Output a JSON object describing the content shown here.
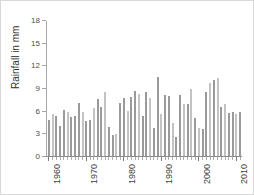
{
  "chart_data": {
    "type": "bar",
    "title": "",
    "xlabel": "",
    "ylabel": "Rainfall  in mm",
    "ylim": [
      0,
      18
    ],
    "yticks": [
      0,
      3,
      6,
      9,
      12,
      15,
      18
    ],
    "ytick_labels": [
      "0",
      "3",
      "6",
      "9",
      "12",
      "15",
      "18"
    ],
    "xlim": [
      1959.5,
      2011.5
    ],
    "xtick_labels": [
      "1960",
      "1970",
      "1980",
      "1990",
      "2000",
      "2010"
    ],
    "xticks": [
      1960,
      1970,
      1980,
      1990,
      2000,
      2010
    ],
    "grid": false,
    "legend": null,
    "bar_color": "#9a9a9a",
    "bar_color_alt": "#c3c3c3",
    "axis_color": "#8c8c8c",
    "categories": [
      "1960",
      "1961",
      "1962",
      "1963",
      "1964",
      "1965",
      "1966",
      "1967",
      "1968",
      "1969",
      "1970",
      "1971",
      "1972",
      "1973",
      "1974",
      "1975",
      "1976",
      "1977",
      "1978",
      "1979",
      "1980",
      "1981",
      "1982",
      "1983",
      "1984",
      "1985",
      "1986",
      "1987",
      "1988",
      "1989",
      "1990",
      "1991",
      "1992",
      "1993",
      "1994",
      "1995",
      "1996",
      "1997",
      "1998",
      "1999",
      "2000",
      "2001",
      "2002",
      "2003",
      "2004",
      "2005",
      "2006",
      "2007",
      "2008",
      "2009",
      "2010",
      "2011"
    ],
    "values": [
      4.8,
      5.6,
      5.3,
      4.0,
      6.1,
      5.9,
      5.2,
      5.4,
      7.1,
      5.9,
      4.7,
      4.8,
      6.4,
      7.6,
      6.6,
      8.5,
      3.9,
      2.8,
      2.9,
      7.1,
      7.7,
      6.0,
      7.9,
      8.7,
      8.3,
      5.4,
      8.6,
      7.7,
      3.8,
      10.6,
      5.6,
      8.1,
      8.0,
      4.4,
      2.6,
      8.1,
      7.0,
      6.9,
      9.0,
      5.1,
      3.7,
      3.6,
      8.6,
      9.7,
      10.1,
      10.4,
      6.6,
      6.9,
      5.8,
      5.9,
      5.6,
      5.9
    ],
    "shade_pattern": [
      0,
      1,
      0,
      0,
      0,
      1,
      0,
      0,
      0,
      1,
      0,
      0,
      1,
      0,
      0,
      1,
      0,
      0,
      1,
      0,
      0,
      1,
      0,
      0,
      1,
      0,
      0,
      1,
      0,
      0,
      1,
      0,
      0,
      1,
      0,
      0,
      1,
      0,
      1,
      0,
      1,
      0,
      0,
      1,
      0,
      1,
      0,
      1,
      0,
      0,
      1,
      0
    ]
  }
}
